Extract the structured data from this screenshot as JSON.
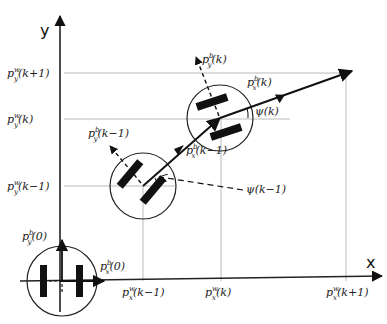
{
  "axes": {
    "x_label": "x",
    "y_label": "y"
  },
  "y_ticks": [
    {
      "label": "p",
      "sup": "w",
      "sub": "y",
      "arg": "(k+1)",
      "y": 73
    },
    {
      "label": "p",
      "sup": "w",
      "sub": "y",
      "arg": "(k)",
      "y": 119
    },
    {
      "label": "p",
      "sup": "w",
      "sub": "y",
      "arg": "(k−1)",
      "y": 186
    }
  ],
  "x_ticks": [
    {
      "label": "p",
      "sup": "w",
      "sub": "x",
      "arg": "(k−1)",
      "x": 143
    },
    {
      "label": "p",
      "sup": "w",
      "sub": "x",
      "arg": "(k)",
      "x": 221
    },
    {
      "label": "p",
      "sup": "w",
      "sub": "x",
      "arg": "(k+1)",
      "x": 346
    }
  ],
  "robots": [
    {
      "name": "robot-origin",
      "cx": 62,
      "cy": 281,
      "r": 35,
      "labels": {
        "py": {
          "sup": "b",
          "sub": "y",
          "arg": "(0)"
        },
        "px": {
          "sup": "b",
          "sub": "x",
          "arg": "(0)"
        }
      }
    },
    {
      "name": "robot-k-minus-1",
      "cx": 143,
      "cy": 186,
      "r": 33,
      "labels": {
        "py": {
          "sup": "b",
          "sub": "y",
          "arg": "(k−1)"
        },
        "px": {
          "sup": "b",
          "sub": "x",
          "arg": "(k−1)"
        },
        "psi": "ψ(k−1)"
      }
    },
    {
      "name": "robot-k",
      "cx": 220,
      "cy": 118,
      "r": 33,
      "labels": {
        "py": {
          "sup": "b",
          "sub": "y",
          "arg": "(k)"
        },
        "px": {
          "sup": "b",
          "sub": "x",
          "arg": "(k)"
        },
        "psi": "ψ(k)"
      }
    }
  ]
}
